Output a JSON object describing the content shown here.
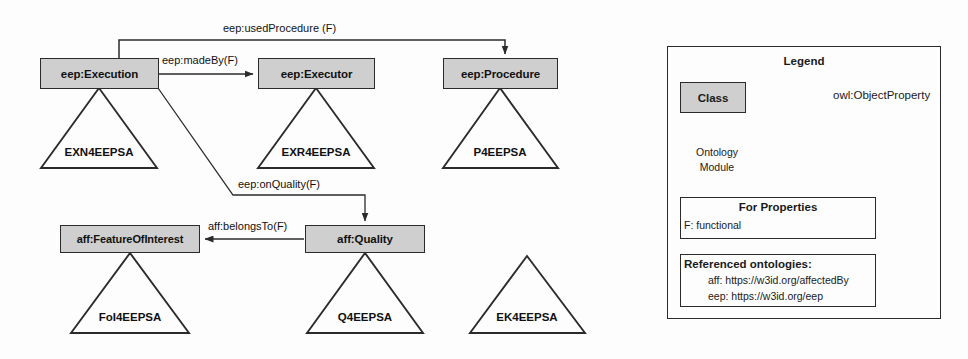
{
  "diagram": {
    "colors": {
      "class_fill": "#cfcfcf",
      "stroke": "#2b2b2b",
      "background": "#fdfdfd"
    },
    "classes": [
      {
        "id": "execution",
        "label": "eep:Execution"
      },
      {
        "id": "executor",
        "label": "eep:Executor"
      },
      {
        "id": "procedure",
        "label": "eep:Procedure"
      },
      {
        "id": "foi",
        "label": "aff:FeatureOfInterest"
      },
      {
        "id": "quality",
        "label": "aff:Quality"
      }
    ],
    "modules": [
      {
        "id": "exn",
        "label": "EXN4EEPSA"
      },
      {
        "id": "exr",
        "label": "EXR4EEPSA"
      },
      {
        "id": "p",
        "label": "P4EEPSA"
      },
      {
        "id": "foim",
        "label": "FoI4EEPSA"
      },
      {
        "id": "q",
        "label": "Q4EEPSA"
      },
      {
        "id": "ek",
        "label": "EK4EEPSA"
      }
    ],
    "properties": [
      {
        "id": "usedprocedure",
        "label": "eep:usedProcedure (F)",
        "from": "execution",
        "to": "procedure"
      },
      {
        "id": "madeby",
        "label": "eep:madeBy(F)",
        "from": "execution",
        "to": "executor"
      },
      {
        "id": "onquality",
        "label": "eep:onQuality(F)",
        "from": "execution",
        "to": "quality"
      },
      {
        "id": "belongsto",
        "label": "aff:belongsTo(F)",
        "from": "quality",
        "to": "foi"
      }
    ]
  },
  "legend": {
    "title": "Legend",
    "class_sample_label": "Class",
    "object_property_label": "owl:ObjectProperty",
    "module_sample_line1": "Ontology",
    "module_sample_line2": "Module",
    "properties_box": {
      "title": "For Properties",
      "lines": [
        "F: functional"
      ]
    },
    "references_box": {
      "title": "Referenced ontologies:",
      "lines": [
        "aff: https://w3id.org/affectedBy",
        "eep: https://w3id.org/eep"
      ]
    }
  }
}
